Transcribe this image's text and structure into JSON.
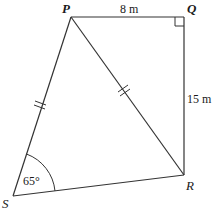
{
  "diagram": {
    "type": "quadrilateral",
    "vertices": {
      "P": {
        "label": "P"
      },
      "Q": {
        "label": "Q"
      },
      "R": {
        "label": "R"
      },
      "S": {
        "label": "S"
      }
    },
    "measurements": {
      "PQ": "8 m",
      "QR": "15 m",
      "angle_S": "65°"
    },
    "markings": {
      "right_angle_at": "Q",
      "equal_sides": [
        "PS",
        "PR"
      ]
    },
    "colors": {
      "line": "#333333",
      "background": "#ffffff"
    }
  }
}
